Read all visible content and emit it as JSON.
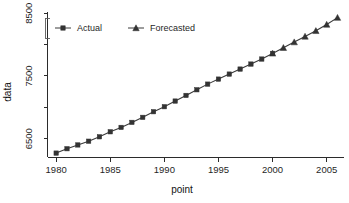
{
  "figure": {
    "title": "",
    "title_clipped": true,
    "background": "#ffffff",
    "foreground": "#1a1a1a"
  },
  "legend": {
    "position": "top-left-inside",
    "orientation": "horizontal",
    "entries": [
      {
        "label": "Actual",
        "marker": "square",
        "color": "#333333"
      },
      {
        "label": "Forecasted",
        "marker": "triangle",
        "color": "#333333"
      }
    ]
  },
  "axes": {
    "x": {
      "title": "point",
      "ticks": [
        "1980",
        "1985",
        "1990",
        "1995",
        "2000",
        "2005"
      ],
      "tick_values": [
        1980,
        1985,
        1990,
        1995,
        2000,
        2005
      ],
      "range": [
        1979.2,
        2006.6
      ]
    },
    "y": {
      "title": "data",
      "ticks": [
        "6500",
        "7500",
        "8500"
      ],
      "tick_values": [
        6500,
        7500,
        8500
      ],
      "minor_tick_values": [
        7000,
        8000
      ],
      "range": [
        6200,
        8520
      ],
      "rotated_label": true
    }
  },
  "chart_data": {
    "type": "line",
    "title": "",
    "xlabel": "point",
    "ylabel": "data",
    "xlim": [
      1979.2,
      2006.6
    ],
    "ylim": [
      6200,
      8520
    ],
    "grid": false,
    "legend_position": "top-left-inside",
    "series": [
      {
        "name": "Actual",
        "marker": "square",
        "color": "#333333",
        "x": [
          1980,
          1981,
          1982,
          1983,
          1984,
          1985,
          1986,
          1987,
          1988,
          1989,
          1990,
          1991,
          1992,
          1993,
          1994,
          1995,
          1996,
          1997,
          1998,
          1999,
          2000
        ],
        "values": [
          6270,
          6340,
          6400,
          6460,
          6530,
          6610,
          6680,
          6760,
          6840,
          6930,
          7010,
          7100,
          7190,
          7280,
          7370,
          7450,
          7530,
          7610,
          7690,
          7770,
          7860
        ]
      },
      {
        "name": "Forecasted",
        "marker": "triangle",
        "color": "#333333",
        "x": [
          2000,
          2001,
          2002,
          2003,
          2004,
          2005,
          2006
        ],
        "values": [
          7860,
          7950,
          8040,
          8130,
          8220,
          8320,
          8430
        ]
      }
    ]
  }
}
